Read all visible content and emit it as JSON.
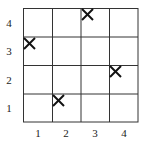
{
  "grid": {
    "rows": 4,
    "cols": 4,
    "line_color": "#333333",
    "mark_color": "#111111",
    "mark_symbol": "X"
  },
  "y_labels": [
    "4",
    "3",
    "2",
    "1"
  ],
  "x_labels": [
    "1",
    "2",
    "3",
    "4"
  ],
  "marks": [
    {
      "col": 3,
      "row": 4
    },
    {
      "col": 1,
      "row": 3
    },
    {
      "col": 4,
      "row": 2
    },
    {
      "col": 2,
      "row": 1
    }
  ]
}
